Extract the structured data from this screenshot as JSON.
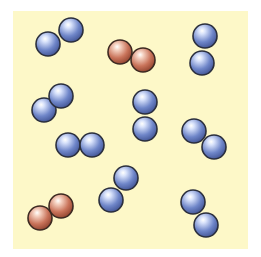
{
  "diagram": {
    "title": "",
    "background": "#ffffff",
    "panel": {
      "x": 13,
      "y": 11,
      "width": 235,
      "height": 238,
      "color": "#fdf8c8"
    },
    "atom_radius": 12,
    "colors": {
      "blue": {
        "fill": "#6f86c9",
        "light": "#d8e2fb",
        "dark": "#3d4f8f",
        "stroke": "#2b2f3d"
      },
      "red": {
        "fill": "#c9735a",
        "light": "#f5d2c2",
        "dark": "#8a3e2a",
        "stroke": "#3d2a22"
      }
    },
    "molecules": [
      {
        "id": "molecule-1",
        "element": "blue",
        "atoms": [
          [
            48,
            44
          ],
          [
            71,
            30
          ]
        ]
      },
      {
        "id": "molecule-2",
        "element": "red",
        "atoms": [
          [
            120,
            52
          ],
          [
            143,
            60
          ]
        ]
      },
      {
        "id": "molecule-3",
        "element": "blue",
        "atoms": [
          [
            205,
            36
          ],
          [
            202,
            63
          ]
        ]
      },
      {
        "id": "molecule-4",
        "element": "blue",
        "atoms": [
          [
            44,
            110
          ],
          [
            61,
            96
          ]
        ]
      },
      {
        "id": "molecule-5",
        "element": "blue",
        "atoms": [
          [
            145,
            102
          ],
          [
            145,
            129
          ]
        ]
      },
      {
        "id": "molecule-6",
        "element": "blue",
        "atoms": [
          [
            194,
            131
          ],
          [
            214,
            147
          ]
        ]
      },
      {
        "id": "molecule-7",
        "element": "blue",
        "atoms": [
          [
            68,
            145
          ],
          [
            92,
            145
          ]
        ]
      },
      {
        "id": "molecule-8",
        "element": "red",
        "atoms": [
          [
            40,
            218
          ],
          [
            61,
            206
          ]
        ]
      },
      {
        "id": "molecule-9",
        "element": "blue",
        "atoms": [
          [
            111,
            200
          ],
          [
            126,
            178
          ]
        ]
      },
      {
        "id": "molecule-10",
        "element": "blue",
        "atoms": [
          [
            193,
            202
          ],
          [
            206,
            225
          ]
        ]
      }
    ],
    "summary": {
      "total_molecules": 10,
      "blue_molecules": 8,
      "red_molecules": 2,
      "atoms_per_molecule": 2
    }
  }
}
